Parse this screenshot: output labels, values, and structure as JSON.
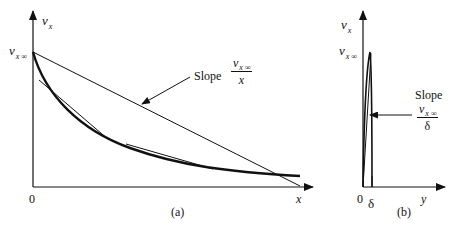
{
  "figure": {
    "panel_a": {
      "y_axis_label": "v",
      "y_axis_label_sub": "x",
      "y_intercept_label": "v",
      "y_intercept_label_sub": "x ∞",
      "x_axis_label": "x",
      "origin_label": "0",
      "panel_label": "(a)",
      "annotation": {
        "text": "Slope",
        "fraction_numerator": "v",
        "fraction_numerator_sub": "x ∞",
        "fraction_denominator": "x"
      }
    },
    "panel_b": {
      "y_axis_label": "v",
      "y_axis_label_sub": "x",
      "y_intercept_label": "v",
      "y_intercept_label_sub": "x ∞",
      "x_axis_label": "y",
      "origin_label": "0",
      "tick_label": "δ",
      "panel_label": "(b)",
      "annotation": {
        "text": "Slope",
        "fraction_numerator": "v",
        "fraction_numerator_sub": "x ∞",
        "fraction_denominator": "δ"
      }
    },
    "colors": {
      "line": "#111111",
      "background": "#ffffff"
    }
  }
}
